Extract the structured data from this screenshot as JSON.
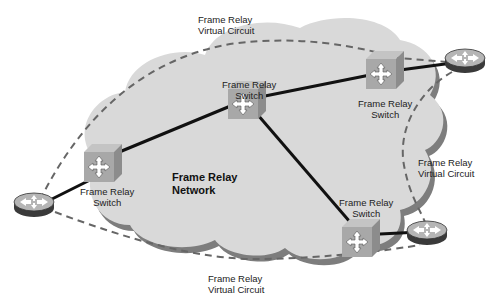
{
  "diagram": {
    "title": "Frame Relay Network",
    "network_label": [
      "Frame Relay",
      "Network"
    ],
    "switches": [
      {
        "id": "sw-left",
        "label": [
          "Frame Relay",
          "Switch"
        ]
      },
      {
        "id": "sw-center",
        "label": [
          "Frame Relay",
          "Switch"
        ]
      },
      {
        "id": "sw-top-right",
        "label": [
          "Frame Relay",
          "Switch"
        ]
      },
      {
        "id": "sw-bottom-right",
        "label": [
          "Frame Relay",
          "Switch"
        ]
      }
    ],
    "routers": [
      {
        "id": "router-left"
      },
      {
        "id": "router-top-right"
      },
      {
        "id": "router-bottom-right"
      }
    ],
    "virtual_circuits": [
      {
        "id": "vc-top",
        "label": [
          "Frame Relay",
          "Virtual Circuit"
        ]
      },
      {
        "id": "vc-right",
        "label": [
          "Frame Relay",
          "Virtual Circuit"
        ]
      },
      {
        "id": "vc-bottom",
        "label": [
          "Frame Relay",
          "Virtual Circuit"
        ]
      }
    ],
    "colors": {
      "cloud": "#d9d9d9",
      "cloud_shadow": "#7a7a7a",
      "switch_face": "#a8a8a8",
      "router_top": "#b5b5b5",
      "router_side": "#3a3a3a",
      "link": "#111111",
      "dashed": "#666666"
    }
  }
}
